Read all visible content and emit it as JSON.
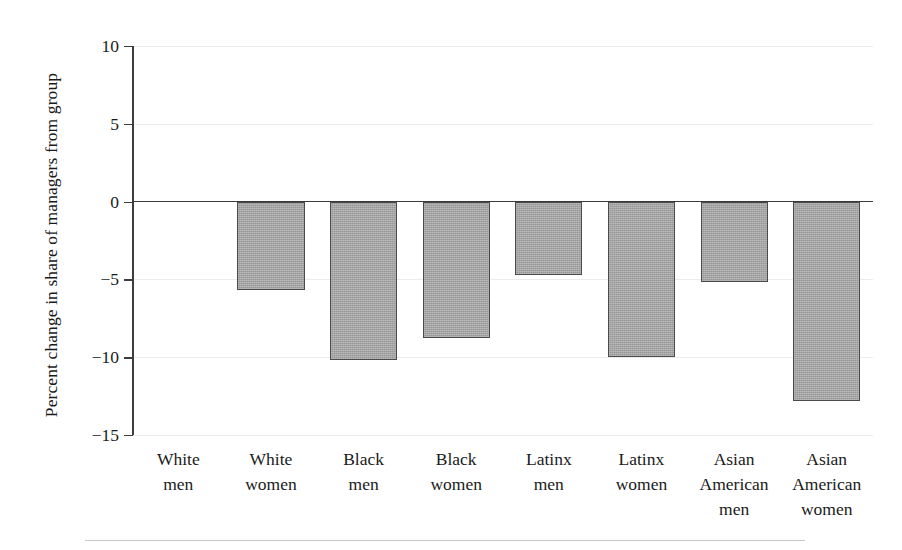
{
  "chart_data": {
    "type": "bar",
    "title": "",
    "subtitle": "",
    "xlabel": "",
    "ylabel": "Percent change in share of managers from group",
    "categories": [
      "White men",
      "White women",
      "Black men",
      "Black women",
      "Latinx men",
      "Latinx women",
      "Asian American men",
      "Asian American women"
    ],
    "category_lines": [
      [
        "White",
        "men"
      ],
      [
        "White",
        "women"
      ],
      [
        "Black",
        "men"
      ],
      [
        "Black",
        "women"
      ],
      [
        "Latinx",
        "men"
      ],
      [
        "Latinx",
        "women"
      ],
      [
        "Asian",
        "American",
        "men"
      ],
      [
        "Asian",
        "American",
        "women"
      ]
    ],
    "values": [
      0,
      -5.7,
      -10.2,
      -8.8,
      -4.7,
      -10.0,
      -5.2,
      -12.8
    ],
    "ylim": [
      -15,
      10
    ],
    "yticks": [
      10,
      5,
      0,
      -5,
      -10,
      -15
    ],
    "ytick_labels": [
      "10",
      "5",
      "0",
      "−5",
      "−10",
      "−15"
    ],
    "grid": true,
    "grid_axis": "y",
    "legend": "none",
    "bar_fill_color": "#a3a3a3",
    "bar_edge_color": "#4a4a4a",
    "gridline_color": "#ececec",
    "axis_color": "#3d3d3d",
    "background_color": "#ffffff",
    "zero_baseline": 0
  }
}
